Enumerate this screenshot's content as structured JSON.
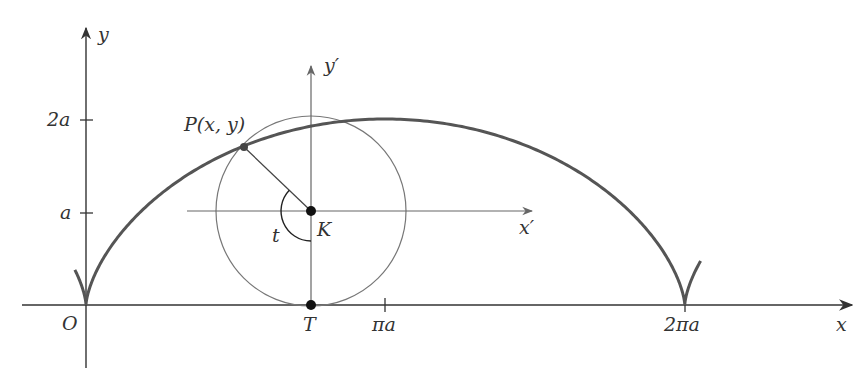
{
  "figure": {
    "colors": {
      "curve": "#555555",
      "axis": "#333333",
      "circle": "#777777",
      "point": "#111111",
      "text": "#333333"
    },
    "axes": {
      "x_label": "x",
      "y_label": "y",
      "origin_label": "O",
      "x_ticks": [
        {
          "label": "πa",
          "value": 3.14159
        },
        {
          "label": "2πa",
          "value": 6.28318
        }
      ],
      "y_ticks": [
        {
          "label": "a",
          "value": 1
        },
        {
          "label": "2a",
          "value": 2
        }
      ]
    },
    "local_axes": {
      "x_label": "x′",
      "y_label": "y′"
    },
    "points": {
      "P": {
        "label": "P(x, y)"
      },
      "K": {
        "label": "K"
      },
      "T": {
        "label": "T"
      }
    },
    "angle_label": "t",
    "cycloid": {
      "equation_x": "a(t − sin t)",
      "equation_y": "a(1 − cos t)",
      "t_shown": 1.3
    }
  },
  "chart_data": {
    "type": "line",
    "title": "",
    "xlabel": "x",
    "ylabel": "y",
    "x_tick_labels": [
      "O",
      "T",
      "πa",
      "2πa"
    ],
    "y_tick_labels": [
      "a",
      "2a"
    ],
    "series": [
      {
        "name": "cycloid",
        "parametric": "x = a(t − sin t), y = a(1 − cos t)",
        "t_range": [
          -0.9,
          7.3
        ]
      },
      {
        "name": "rolling circle",
        "center": "K = (a·t, a)",
        "radius": "a"
      }
    ],
    "annotations": [
      "P(x, y)",
      "K",
      "T",
      "t",
      "x′",
      "y′"
    ],
    "grid": false
  }
}
